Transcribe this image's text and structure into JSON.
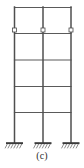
{
  "figure": {
    "caption": "(c)",
    "member_color": "#4a4a4a",
    "member_color_light": "#6e6e6e",
    "support_color": "#3a3a3a",
    "hinge_fill": "#ffffff",
    "background": "#ffffff",
    "line_width_column": 1.6,
    "line_width_beam": 1.2
  },
  "geometry": {
    "units": "pixels",
    "canvas": {
      "width": 84,
      "height": 168
    },
    "columns": [
      {
        "name": "left-column",
        "x": 14.5,
        "y_top": 7,
        "y_base": 143
      },
      {
        "name": "middle-column",
        "x": 43.0,
        "y_top": 7,
        "y_base": 143
      },
      {
        "name": "right-column",
        "x": 71.0,
        "y_top": 7,
        "y_base": 143
      }
    ],
    "beams": [
      {
        "name": "roof-beam",
        "level": 5,
        "y": 7.5,
        "x_start": 14.5,
        "x_end": 71.0
      },
      {
        "name": "floor-beam-4",
        "level": 4,
        "y": 33.5,
        "x_start": 14.5,
        "x_end": 71.0
      },
      {
        "name": "floor-beam-3",
        "level": 3,
        "y": 60.0,
        "x_start": 14.5,
        "x_end": 71.0
      },
      {
        "name": "floor-beam-2",
        "level": 2,
        "y": 86.5,
        "x_start": 14.5,
        "x_end": 71.0
      },
      {
        "name": "floor-beam-1",
        "level": 1,
        "y": 112.5,
        "x_start": 14.5,
        "x_end": 71.0
      }
    ],
    "hinges": [
      {
        "name": "hinge-left",
        "x": 14.5,
        "y": 30.0,
        "size": 4.0
      },
      {
        "name": "hinge-middle",
        "x": 43.0,
        "y": 30.0,
        "size": 4.0
      },
      {
        "name": "hinge-right",
        "x": 71.0,
        "y": 30.0,
        "size": 4.0
      }
    ],
    "supports": [
      {
        "name": "fixed-support-left",
        "x": 14.5,
        "y": 143,
        "width": 17,
        "type": "fixed"
      },
      {
        "name": "fixed-support-middle",
        "x": 43.0,
        "y": 143,
        "width": 17,
        "type": "fixed"
      },
      {
        "name": "fixed-support-right",
        "x": 71.0,
        "y": 143,
        "width": 17,
        "type": "fixed"
      }
    ],
    "bays": 2,
    "stories": 5
  }
}
